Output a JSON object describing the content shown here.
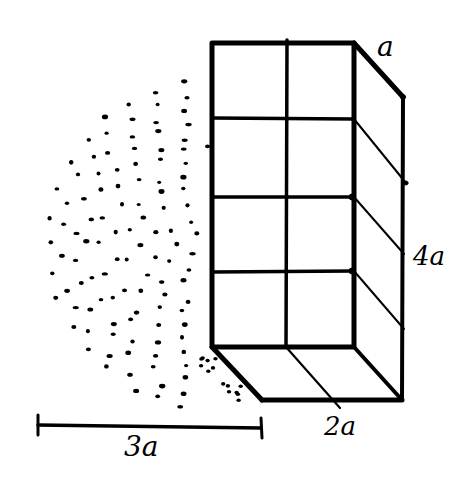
{
  "diagram": {
    "title": "",
    "colors": {
      "ink": "#000000",
      "background": "#ffffff"
    },
    "labels": {
      "depth": "a",
      "height": "4a",
      "width": "2a",
      "radius": "3a"
    },
    "prism": {
      "front_face": {
        "x0": 212,
        "y0": 43,
        "x1": 354,
        "y1": 347
      },
      "depth_offset": {
        "dx": 49,
        "dy": 54
      },
      "grid": {
        "columns": 2,
        "rows": 4
      }
    },
    "stipple_region": {
      "shape": "half-disc",
      "center": [
        212,
        245
      ],
      "radius": 165
    },
    "scale_bar": {
      "x0": 38,
      "x1": 261,
      "y": 425,
      "label": "3a"
    }
  }
}
